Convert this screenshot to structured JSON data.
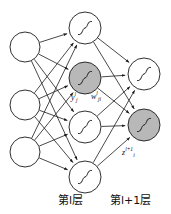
{
  "figure": {
    "type": "neural-network-diagram"
  },
  "colors": {
    "stroke": "#1a1a1a",
    "node_fill_plain": "#ffffff",
    "node_fill_highlight": "#b8b8b8",
    "background": "#ffffff",
    "text": "#111111"
  },
  "labels": {
    "output_activation": {
      "base": "y",
      "sub": "j",
      "sup": "l"
    },
    "weight": {
      "base": "w",
      "sub": "ji",
      "sup": "l"
    },
    "net_input": {
      "base": "z",
      "sub": "i",
      "sup": "l+1"
    },
    "layer_l": "第l层",
    "layer_l_plus_1": "第l+1层"
  },
  "layers": [
    {
      "name": "input-layer",
      "node_radius": 15,
      "nodes": [
        {
          "id": "in-1",
          "cx": 25,
          "cy": 47,
          "highlight": false,
          "glyph": "none"
        },
        {
          "id": "in-2",
          "cx": 25,
          "cy": 105,
          "highlight": false,
          "glyph": "none"
        },
        {
          "id": "in-3",
          "cx": 25,
          "cy": 152,
          "highlight": false,
          "glyph": "none"
        }
      ]
    },
    {
      "name": "layer-l",
      "node_radius": 16,
      "nodes": [
        {
          "id": "l-1",
          "cx": 85,
          "cy": 28,
          "highlight": false,
          "glyph": "sigmoid"
        },
        {
          "id": "l-2",
          "cx": 85,
          "cy": 78,
          "highlight": true,
          "glyph": "sigmoid"
        },
        {
          "id": "l-3",
          "cx": 85,
          "cy": 127,
          "highlight": false,
          "glyph": "sigmoid"
        },
        {
          "id": "l-4",
          "cx": 85,
          "cy": 177,
          "highlight": false,
          "glyph": "sigmoid"
        }
      ]
    },
    {
      "name": "layer-l-plus-1",
      "node_radius": 16,
      "nodes": [
        {
          "id": "o-1",
          "cx": 144,
          "cy": 74,
          "highlight": false,
          "glyph": "sigmoid"
        },
        {
          "id": "o-2",
          "cx": 144,
          "cy": 125,
          "highlight": true,
          "glyph": "sigmoid"
        }
      ]
    }
  ],
  "edges": {
    "input_to_l": [
      [
        "in-1",
        "l-1"
      ],
      [
        "in-1",
        "l-2"
      ],
      [
        "in-1",
        "l-3"
      ],
      [
        "in-1",
        "l-4"
      ],
      [
        "in-2",
        "l-1"
      ],
      [
        "in-2",
        "l-2"
      ],
      [
        "in-2",
        "l-3"
      ],
      [
        "in-2",
        "l-4"
      ],
      [
        "in-3",
        "l-1"
      ],
      [
        "in-3",
        "l-2"
      ],
      [
        "in-3",
        "l-3"
      ],
      [
        "in-3",
        "l-4"
      ]
    ],
    "l_to_lplus1": [
      [
        "l-1",
        "o-1"
      ],
      [
        "l-1",
        "o-2"
      ],
      [
        "l-2",
        "o-1"
      ],
      [
        "l-2",
        "o-2"
      ],
      [
        "l-3",
        "o-1"
      ],
      [
        "l-3",
        "o-2"
      ],
      [
        "l-4",
        "o-1"
      ],
      [
        "l-4",
        "o-2"
      ]
    ]
  }
}
